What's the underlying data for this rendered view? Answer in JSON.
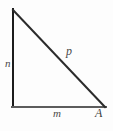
{
  "figure": {
    "kind": "right-triangle-diagram",
    "background_color": "#fdfdfd",
    "labels": {
      "vertical_leg": "n",
      "hypotenuse": "p",
      "horizontal_leg": "m",
      "vertex": "A"
    },
    "strokes": {
      "vertical_leg_color": "#1c1c1c",
      "hypotenuse_color": "#2b2b2b",
      "horizontal_leg_color": "#5c5c5c",
      "stroke_width": 2
    },
    "geometry": {
      "top_vertex": [
        13,
        10
      ],
      "right_angle_vertex": [
        13,
        107
      ],
      "vertex_A": [
        105,
        107
      ]
    }
  }
}
